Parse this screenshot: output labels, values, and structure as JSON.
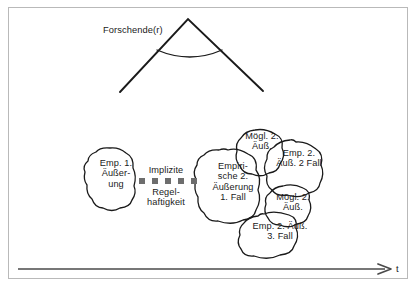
{
  "figure": {
    "title_label": "Forschende(r)",
    "axis": {
      "label": "t",
      "direction": "left-to-right",
      "arrowhead": "right"
    },
    "border_color": "#b9b9b9",
    "ink_color": "#1a1a1a",
    "dot_color": "#6d6d6d",
    "background": "#ffffff"
  },
  "researcher": {
    "label": "Forschende(r)",
    "cone": {
      "apex_x": 188,
      "apex_y": 19,
      "left_end_x": 120,
      "left_end_y": 92,
      "right_end_x": 263,
      "right_end_y": 91,
      "arc": "angle-arc"
    }
  },
  "implicit_regularity": {
    "line_1": "Implizite",
    "line_2": "Regel-\nhaftigkeit",
    "dot_count": 5,
    "dots": [
      {
        "x": 139,
        "y": 178
      },
      {
        "x": 152,
        "y": 178
      },
      {
        "x": 165,
        "y": 178
      },
      {
        "x": 178,
        "y": 178
      },
      {
        "x": 191,
        "y": 178
      }
    ]
  },
  "blobs": [
    {
      "id": "emp-1-aeusserung",
      "text": "Emp. 1.\nÄußer-\nung",
      "role": "empirical-utterance-1"
    },
    {
      "id": "empirische-2-aeusserung-1-fall",
      "text": "Empiri-\nsche 2.\nÄußerung\n1. Fall",
      "role": "empirical-2nd-utterance-case-1"
    },
    {
      "id": "moegl-2-aeuss-a",
      "text": "Mögl. 2.\nÄuß.",
      "role": "possible-2nd-utterance-a"
    },
    {
      "id": "emp-2-aeuss-2-fall",
      "text": "Emp. 2.\nÄuß. 2 Fall",
      "role": "empirical-2nd-utterance-case-2"
    },
    {
      "id": "moegl-2-aeuss-b",
      "text": "Mögl. 2.\nÄuß.",
      "role": "possible-2nd-utterance-b"
    },
    {
      "id": "emp-2-aeuss-3-fall",
      "text": "Emp. 2. Äuß.\n3. Fall",
      "role": "empirical-2nd-utterance-case-3"
    }
  ]
}
